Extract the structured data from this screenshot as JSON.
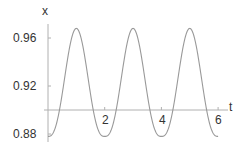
{
  "chart_data": {
    "type": "line",
    "title": "",
    "xlabel": "t",
    "ylabel": "x",
    "xlim": [
      0,
      6.1
    ],
    "ylim": [
      0.875,
      0.975
    ],
    "x_ticks": [
      2,
      4,
      6
    ],
    "x_tick_labels": [
      "2",
      "4",
      "6"
    ],
    "y_ticks": [
      0.88,
      0.92,
      0.96
    ],
    "y_tick_labels": [
      "0.88",
      "0.92",
      "0.96"
    ],
    "axis_crossing": {
      "x_axis_at_y": 0.9,
      "y_axis_at_x": 0
    },
    "grid": false,
    "legend": null,
    "series": [
      {
        "name": "x(t)",
        "color": "#999999",
        "period": 2.0,
        "max": 0.968,
        "min": 0.878,
        "x": [
          0,
          0.25,
          0.5,
          0.75,
          1.0,
          1.25,
          1.5,
          1.75,
          2.0,
          2.25,
          2.5,
          2.75,
          3.0,
          3.25,
          3.5,
          3.75,
          4.0,
          4.25,
          4.5,
          4.75,
          5.0,
          5.25,
          5.5,
          5.75,
          6.0
        ],
        "y": [
          0.878,
          0.885,
          0.928,
          0.962,
          0.968,
          0.962,
          0.928,
          0.885,
          0.878,
          0.885,
          0.928,
          0.962,
          0.968,
          0.962,
          0.928,
          0.885,
          0.878,
          0.885,
          0.928,
          0.962,
          0.968,
          0.962,
          0.928,
          0.885,
          0.878
        ]
      }
    ]
  },
  "axes": {
    "x_label": "t",
    "y_label": "x",
    "x_tick_labels": [
      "2",
      "4",
      "6"
    ],
    "y_tick_labels": [
      "0.96",
      "0.92",
      "0.88"
    ]
  },
  "colors": {
    "axis": "#aaaaaa",
    "curve": "#999999",
    "text": "#333333"
  }
}
